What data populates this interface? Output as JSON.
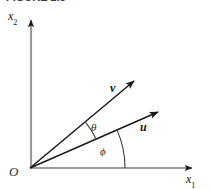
{
  "figure": {
    "caption_partial": "FIGURE 2.5",
    "background_color": "#ffffff",
    "axis_color": "#9a9a9a",
    "vector_color": "#1a1a1a",
    "arc_color": "#3a3a3a",
    "text_color": "#111111",
    "width": 212,
    "height": 190
  },
  "axes": {
    "origin_label": "O",
    "horizontal": {
      "label": "x",
      "subscript": "1",
      "start_x": 30,
      "start_y": 168,
      "end_x": 197,
      "end_y": 168
    },
    "vertical": {
      "label": "x",
      "subscript": "2",
      "start_x": 31,
      "start_y": 168,
      "end_x": 31,
      "end_y": 14
    }
  },
  "vectors": [
    {
      "name": "v",
      "label": "v",
      "origin_x": 30,
      "origin_y": 168,
      "tip_x": 140,
      "tip_y": 74,
      "angle_degrees": 40
    },
    {
      "name": "u",
      "label": "u",
      "origin_x": 30,
      "origin_y": 168,
      "tip_x": 165,
      "tip_y": 107,
      "angle_degrees": 24
    }
  ],
  "angles": [
    {
      "name": "theta",
      "label": "θ",
      "between": "v-and-u",
      "radius": 72,
      "start_degrees": 24,
      "end_degrees": 40
    },
    {
      "name": "phi",
      "label": "ϕ",
      "between": "x1-axis-and-u",
      "radius": 95,
      "start_degrees": 0,
      "end_degrees": 24
    }
  ]
}
